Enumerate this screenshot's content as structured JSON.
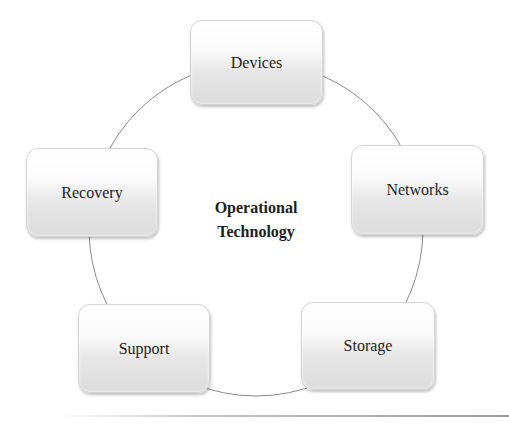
{
  "diagram": {
    "center": {
      "line1": "Operational",
      "line2": "Technology"
    },
    "nodes": [
      {
        "label": "Devices"
      },
      {
        "label": "Networks"
      },
      {
        "label": "Storage"
      },
      {
        "label": "Support"
      },
      {
        "label": "Recovery"
      }
    ],
    "colors": {
      "node_fill_top": "#ffffff",
      "node_fill_bottom": "#dcdcdc",
      "connector": "#8a8a8a",
      "text": "#1e1e1e"
    }
  }
}
